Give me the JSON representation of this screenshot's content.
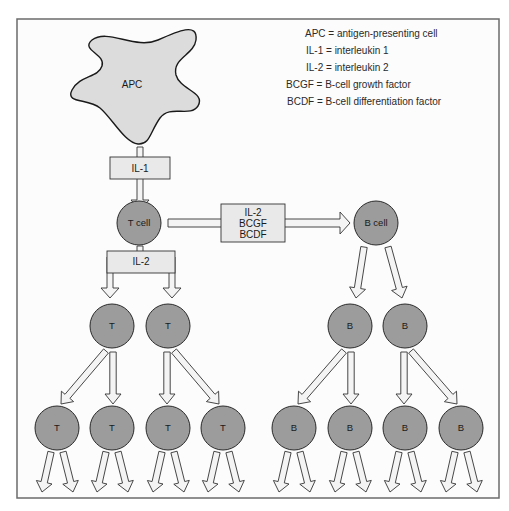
{
  "legend": [
    {
      "abbr": "APC",
      "text": "APC = antigen-presenting cell"
    },
    {
      "abbr": "IL-1",
      "text": "IL-1 = interleukin 1"
    },
    {
      "abbr": "IL-2",
      "text": "IL-2 = interleukin 2"
    },
    {
      "abbr": "BCGF",
      "text": "BCGF = B-cell growth factor"
    },
    {
      "abbr": "BCDF",
      "text": "BCDF = B-cell differentiation factor"
    }
  ],
  "apc": {
    "label": "APC"
  },
  "il1_box": {
    "label": "IL-1"
  },
  "t_cell": {
    "label": "T cell"
  },
  "b_cell": {
    "label": "B cell"
  },
  "factors_box": {
    "lines": [
      "IL-2",
      "BCGF",
      "BCDF"
    ]
  },
  "il2_box": {
    "label": "IL-2"
  },
  "t_gen1": [
    "T",
    "T"
  ],
  "t_gen2": [
    "T",
    "T",
    "T",
    "T"
  ],
  "b_gen1": [
    "B",
    "B"
  ],
  "b_gen2": [
    "B",
    "B",
    "B",
    "B"
  ],
  "colors": {
    "cell_fill": "#9c9c9c",
    "apc_fill": "#dcdcdc",
    "box_fill": "#e9e9e9"
  }
}
